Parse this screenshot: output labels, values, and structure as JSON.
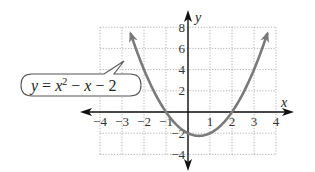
{
  "chart_data": {
    "type": "line",
    "title": "",
    "equation_label": "y = x^2 − x − 2",
    "function": "x^2 - x - 2",
    "xlabel": "x",
    "ylabel": "y",
    "xlim": [
      -4,
      4
    ],
    "ylim": [
      -4,
      8
    ],
    "grid": true,
    "x_ticks": [
      -4,
      -3,
      -2,
      -1,
      1,
      2,
      3,
      4
    ],
    "y_ticks": [
      -4,
      -2,
      2,
      4,
      6,
      8
    ],
    "x_tick_labels": [
      "−4",
      "−3",
      "−2",
      "−1",
      "1",
      "2",
      "3",
      "4"
    ],
    "y_tick_labels": [
      "−4",
      "−2",
      "2",
      "4",
      "6",
      "8"
    ],
    "series": [
      {
        "name": "y = x^2 − x − 2",
        "x": [
          -2.6,
          -2,
          -1.5,
          -1,
          -0.5,
          0,
          0.5,
          1,
          1.5,
          2,
          2.5,
          3,
          3.6
        ],
        "values": [
          7.36,
          4,
          1.75,
          0,
          -1.25,
          -2,
          -2.25,
          -2,
          -1.25,
          0,
          1.75,
          4,
          7.36
        ],
        "color": "#7a7a7a",
        "arrows": "both-ends"
      }
    ],
    "key_points": {
      "vertex": [
        0.5,
        -2.25
      ],
      "x_intercepts": [
        -1,
        2
      ],
      "y_intercept": -2
    },
    "colors": {
      "curve": "#7a7a7a",
      "axes": "#111111",
      "grid": "#9a9a9a"
    }
  },
  "labels": {
    "x_axis": "x",
    "y_axis": "y",
    "callout_y": "y",
    "callout_eq": " = ",
    "callout_x1": "x",
    "callout_sup": "2",
    "callout_minus1": " − ",
    "callout_x2": "x",
    "callout_minus2": " − 2"
  }
}
